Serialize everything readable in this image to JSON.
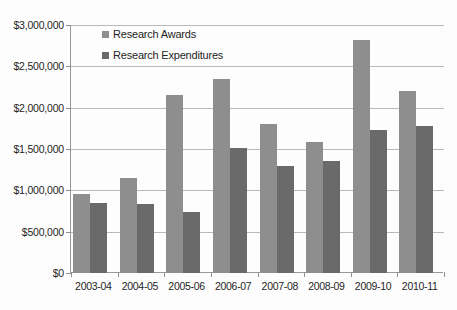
{
  "chart_data": {
    "type": "bar",
    "title": "",
    "xlabel": "",
    "ylabel": "",
    "ylim": [
      0,
      3000000
    ],
    "ytick_values": [
      0,
      500000,
      1000000,
      1500000,
      2000000,
      2500000,
      3000000
    ],
    "ytick_labels": [
      "$0",
      "$500,000",
      "$1,000,000",
      "$1,500,000",
      "$2,000,000",
      "$2,500,000",
      "$3,000,000"
    ],
    "grid": true,
    "legend_position": "upper left (inside plot)",
    "categories": [
      "2003-04",
      "2004-05",
      "2005-06",
      "2006-07",
      "2007-08",
      "2008-09",
      "2009-10",
      "2010-11"
    ],
    "series": [
      {
        "name": "Research Awards",
        "color": "#8e8e8e",
        "values": [
          960000,
          1150000,
          2150000,
          2350000,
          1800000,
          1585000,
          2820000,
          2200000
        ]
      },
      {
        "name": "Research Expenditures",
        "color": "#6a6a6a",
        "values": [
          850000,
          830000,
          740000,
          1510000,
          1290000,
          1360000,
          1730000,
          1780000
        ]
      }
    ]
  },
  "legend": {
    "items": [
      {
        "label": "Research Awards",
        "color": "#8e8e8e"
      },
      {
        "label": "Research Expenditures",
        "color": "#6a6a6a"
      }
    ]
  },
  "colors": {
    "awards": "#8e8e8e",
    "expenditures": "#6a6a6a",
    "gridline": "#b9b9b9",
    "axis": "#9a9a9a",
    "background": "#fdfdfd",
    "text": "#252525"
  }
}
